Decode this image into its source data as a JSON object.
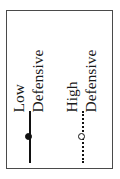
{
  "figure": {
    "kind": "legend-panel",
    "orientation": "rotated-90-ccw",
    "background_color": "#ffffff",
    "frame_color": "#4a4a4a",
    "ink_color": "#111111"
  },
  "legend": {
    "entries": [
      {
        "label_full": "Low Defensive",
        "label_words": [
          "Low",
          "Defensive"
        ],
        "marker": {
          "line_style": "solid",
          "point_style": "filled-circle",
          "color": "#111111"
        }
      },
      {
        "label_full": "High Defensive",
        "label_words": [
          "High",
          "Defensive"
        ],
        "marker": {
          "line_style": "dotted",
          "point_style": "open-circle",
          "color": "#111111"
        }
      }
    ]
  },
  "chart_data": {
    "type": "table",
    "title": "",
    "xlabel": "",
    "ylabel": "",
    "legend_position": "standalone-panel",
    "grid": false,
    "series": [
      {
        "name": "Low Defensive",
        "marker": "filled-circle",
        "line_style": "solid",
        "color": "#111111"
      },
      {
        "name": "High Defensive",
        "marker": "open-circle",
        "line_style": "dotted",
        "color": "#111111"
      }
    ]
  }
}
